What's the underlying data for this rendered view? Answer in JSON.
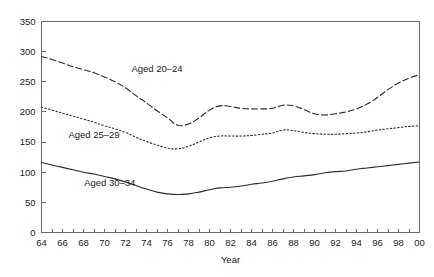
{
  "chart_data": {
    "type": "line",
    "title": "",
    "subtitle": "",
    "xlabel": "Year",
    "ylabel": "",
    "xlim": [
      1964,
      2000
    ],
    "ylim": [
      0,
      350
    ],
    "grid": false,
    "legend_position": "inline-annotations",
    "y_ticks": [
      0,
      50,
      100,
      150,
      200,
      250,
      300,
      350
    ],
    "y_tick_labels": [
      "0",
      "50",
      "100",
      "150",
      "200",
      "250",
      "300",
      "350"
    ],
    "x_ticks": [
      1964,
      1965,
      1966,
      1967,
      1968,
      1969,
      1970,
      1971,
      1972,
      1973,
      1974,
      1975,
      1976,
      1977,
      1978,
      1979,
      1980,
      1981,
      1982,
      1983,
      1984,
      1985,
      1986,
      1987,
      1988,
      1989,
      1990,
      1991,
      1992,
      1993,
      1994,
      1995,
      1996,
      1997,
      1998,
      1999,
      2000
    ],
    "x_tick_labels": [
      "64",
      "",
      "66",
      "",
      "68",
      "",
      "70",
      "",
      "72",
      "",
      "74",
      "",
      "76",
      "",
      "78",
      "",
      "80",
      "",
      "82",
      "",
      "84",
      "",
      "86",
      "",
      "88",
      "",
      "90",
      "",
      "92",
      "",
      "94",
      "",
      "96",
      "",
      "98",
      "",
      "00"
    ],
    "x": [
      1964,
      1965,
      1966,
      1967,
      1968,
      1969,
      1970,
      1971,
      1972,
      1973,
      1974,
      1975,
      1976,
      1977,
      1978,
      1979,
      1980,
      1981,
      1982,
      1983,
      1984,
      1985,
      1986,
      1987,
      1988,
      1989,
      1990,
      1991,
      1992,
      1993,
      1994,
      1995,
      1996,
      1997,
      1998,
      1999,
      2000
    ],
    "series": [
      {
        "name": "Aged 20-24",
        "label": "Aged 20–24",
        "style": "dashed",
        "dash_pattern": "6,3",
        "color": "#2b2b2b",
        "label_x": 1975,
        "label_y": 272,
        "values": [
          292,
          287,
          281,
          275,
          270,
          265,
          258,
          250,
          240,
          227,
          215,
          202,
          190,
          178,
          180,
          190,
          203,
          210,
          209,
          206,
          205,
          205,
          206,
          211,
          210,
          204,
          197,
          195,
          197,
          200,
          205,
          213,
          224,
          237,
          248,
          256,
          262
        ]
      },
      {
        "name": "Aged 25-29",
        "label": "Aged 25–29",
        "style": "dotted",
        "dash_pattern": "1.5,2.2",
        "color": "#2b2b2b",
        "label_x": 1969,
        "label_y": 162,
        "values": [
          208,
          203,
          198,
          193,
          188,
          183,
          177,
          172,
          166,
          158,
          151,
          145,
          140,
          139,
          143,
          150,
          157,
          160,
          160,
          160,
          161,
          163,
          165,
          170,
          169,
          166,
          164,
          163,
          163,
          164,
          165,
          167,
          170,
          172,
          174,
          176,
          177
        ]
      },
      {
        "name": "Aged 30-34",
        "label": "Aged 30–34",
        "style": "solid",
        "dash_pattern": "none",
        "color": "#2b2b2b",
        "label_x": 1970.5,
        "label_y": 82,
        "values": [
          116,
          112,
          108,
          104,
          100,
          97,
          93,
          89,
          84,
          78,
          72,
          67,
          64,
          63,
          64,
          67,
          71,
          74,
          75,
          77,
          80,
          82,
          85,
          89,
          92,
          94,
          96,
          99,
          101,
          102,
          105,
          107,
          109,
          111,
          113,
          115,
          117
        ]
      }
    ]
  },
  "axis": {
    "x_title": "Year"
  }
}
